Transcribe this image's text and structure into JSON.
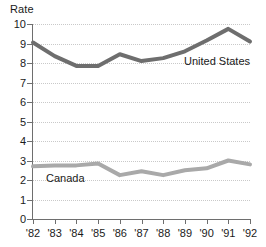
{
  "chart_data": {
    "type": "line",
    "title": "",
    "subtitle": "",
    "xlabel": "",
    "ylabel": "Rate",
    "ylim": [
      0,
      10
    ],
    "xlim": [
      "'82",
      "'92"
    ],
    "grid": "horizontal-dotted",
    "legend_position": "inline-annotation",
    "categories": [
      "'82",
      "'83",
      "'84",
      "'85",
      "'86",
      "'87",
      "'88",
      "'89",
      "'90",
      "'91",
      "'92"
    ],
    "ytick_labels": [
      "10",
      "9",
      "8",
      "7",
      "6",
      "5",
      "4",
      "3",
      "2",
      "1",
      "0"
    ],
    "ytick_values": [
      10,
      9,
      8,
      7,
      6,
      5,
      4,
      3,
      2,
      1,
      0
    ],
    "series": [
      {
        "name": "United States",
        "color": "#6e6e6e",
        "values": [
          9.05,
          8.35,
          7.85,
          7.85,
          8.45,
          8.1,
          8.25,
          8.6,
          9.15,
          9.75,
          9.1
        ]
      },
      {
        "name": "Canada",
        "color": "#a9a9a9",
        "values": [
          2.7,
          2.75,
          2.75,
          2.85,
          2.25,
          2.45,
          2.25,
          2.5,
          2.6,
          3.0,
          2.8
        ]
      }
    ],
    "annotations": [
      {
        "text": "United States",
        "series": "United States"
      },
      {
        "text": "Canada",
        "series": "Canada"
      }
    ]
  }
}
